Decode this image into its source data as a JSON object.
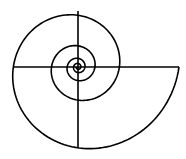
{
  "diagram": {
    "type": "logarithmic-spiral",
    "stroke_color": "#000000",
    "background": "#ffffff",
    "stroke_width": 1.6,
    "center": [
      78,
      67
    ],
    "start_radius": 101,
    "quarter_turn_ratio": 0.8,
    "turns": 4.5,
    "axes": {
      "horizontal": {
        "x1": 13,
        "x2": 179,
        "y": 67
      },
      "vertical": {
        "x": 78,
        "y1": 11,
        "y2": 148
      }
    }
  }
}
